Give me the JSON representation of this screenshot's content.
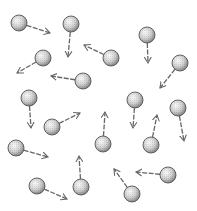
{
  "diagram": {
    "particle_radius": 8,
    "colors": {
      "particle_light": "#f2f2f2",
      "particle_dark": "#8a8a8a",
      "outline": "#555555",
      "arrow": "#666666"
    },
    "particles": [
      {
        "cx": 19,
        "cy": 23,
        "ax": 50,
        "ay": 33
      },
      {
        "cx": 71,
        "cy": 24,
        "ax": 68,
        "ay": 57
      },
      {
        "cx": 147,
        "cy": 35,
        "ax": 148,
        "ay": 63
      },
      {
        "cx": 180,
        "cy": 63,
        "ax": 160,
        "ay": 88
      },
      {
        "cx": 43,
        "cy": 58,
        "ax": 17,
        "ay": 73
      },
      {
        "cx": 111,
        "cy": 58,
        "ax": 84,
        "ay": 45
      },
      {
        "cx": 83,
        "cy": 81,
        "ax": 51,
        "ay": 76
      },
      {
        "cx": 29,
        "cy": 98,
        "ax": 31,
        "ay": 128
      },
      {
        "cx": 52,
        "cy": 127,
        "ax": 80,
        "ay": 113
      },
      {
        "cx": 135,
        "cy": 100,
        "ax": 133,
        "ay": 128
      },
      {
        "cx": 178,
        "cy": 108,
        "ax": 184,
        "ay": 141
      },
      {
        "cx": 103,
        "cy": 144,
        "ax": 105,
        "ay": 112
      },
      {
        "cx": 151,
        "cy": 145,
        "ax": 157,
        "ay": 115
      },
      {
        "cx": 16,
        "cy": 148,
        "ax": 48,
        "ay": 157
      },
      {
        "cx": 168,
        "cy": 175,
        "ax": 136,
        "ay": 172
      },
      {
        "cx": 37,
        "cy": 186,
        "ax": 67,
        "ay": 199
      },
      {
        "cx": 81,
        "cy": 187,
        "ax": 79,
        "ay": 156
      },
      {
        "cx": 132,
        "cy": 194,
        "ax": 114,
        "ay": 169
      }
    ]
  }
}
